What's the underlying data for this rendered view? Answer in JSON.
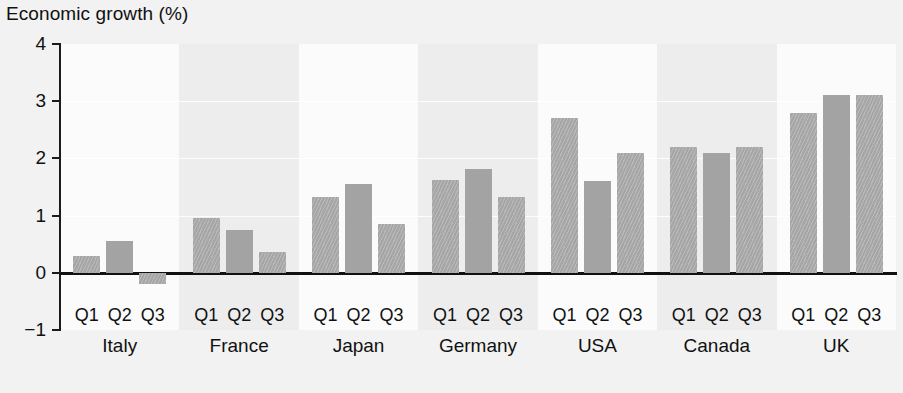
{
  "chart_data": {
    "type": "bar",
    "title": "Economic growth (%)",
    "xlabel": "",
    "ylabel": "",
    "ylim": [
      -1,
      4
    ],
    "yticks": [
      4,
      3,
      2,
      1,
      0,
      -1
    ],
    "ytick_labels": [
      "4",
      "3",
      "2",
      "1",
      "0",
      "−1"
    ],
    "grid": true,
    "legend": "none",
    "categories": [
      "Italy",
      "France",
      "Japan",
      "Germany",
      "USA",
      "Canada",
      "UK"
    ],
    "quarter_labels": [
      "Q1",
      "Q2",
      "Q3"
    ],
    "series": [
      {
        "name": "Q1",
        "values": [
          0.3,
          0.95,
          1.33,
          1.63,
          2.7,
          2.2,
          2.8
        ]
      },
      {
        "name": "Q2",
        "values": [
          0.55,
          0.75,
          1.55,
          1.82,
          1.6,
          2.1,
          3.1
        ]
      },
      {
        "name": "Q3",
        "values": [
          -0.2,
          0.37,
          0.85,
          1.32,
          2.1,
          2.2,
          3.1
        ]
      }
    ],
    "groups": [
      {
        "country": "Italy",
        "bars": [
          {
            "q": "Q1",
            "value": 0.3,
            "style": "hatch"
          },
          {
            "q": "Q2",
            "value": 0.55,
            "style": "solid"
          },
          {
            "q": "Q3",
            "value": -0.2,
            "style": "hatch"
          }
        ]
      },
      {
        "country": "France",
        "bars": [
          {
            "q": "Q1",
            "value": 0.95,
            "style": "hatch"
          },
          {
            "q": "Q2",
            "value": 0.75,
            "style": "solid"
          },
          {
            "q": "Q3",
            "value": 0.37,
            "style": "hatch"
          }
        ]
      },
      {
        "country": "Japan",
        "bars": [
          {
            "q": "Q1",
            "value": 1.33,
            "style": "hatch"
          },
          {
            "q": "Q2",
            "value": 1.55,
            "style": "solid"
          },
          {
            "q": "Q3",
            "value": 0.85,
            "style": "hatch"
          }
        ]
      },
      {
        "country": "Germany",
        "bars": [
          {
            "q": "Q1",
            "value": 1.63,
            "style": "hatch"
          },
          {
            "q": "Q2",
            "value": 1.82,
            "style": "solid"
          },
          {
            "q": "Q3",
            "value": 1.32,
            "style": "hatch"
          }
        ]
      },
      {
        "country": "USA",
        "bars": [
          {
            "q": "Q1",
            "value": 2.7,
            "style": "hatch"
          },
          {
            "q": "Q2",
            "value": 1.6,
            "style": "solid"
          },
          {
            "q": "Q3",
            "value": 2.1,
            "style": "hatch"
          }
        ]
      },
      {
        "country": "Canada",
        "bars": [
          {
            "q": "Q1",
            "value": 2.2,
            "style": "hatch"
          },
          {
            "q": "Q2",
            "value": 2.1,
            "style": "solid"
          },
          {
            "q": "Q3",
            "value": 2.2,
            "style": "hatch"
          }
        ]
      },
      {
        "country": "UK",
        "bars": [
          {
            "q": "Q1",
            "value": 2.8,
            "style": "hatch"
          },
          {
            "q": "Q2",
            "value": 3.1,
            "style": "solid"
          },
          {
            "q": "Q3",
            "value": 3.1,
            "style": "hatch"
          }
        ]
      }
    ],
    "colors": {
      "background": "#f2f2f2",
      "plot_band_light": "#fbfbfb",
      "plot_band_dim": "#ededed",
      "bar_solid": "#a3a3a3",
      "bar_hatch": "#b0b0b0",
      "axis": "#111111",
      "text": "#111111"
    }
  }
}
